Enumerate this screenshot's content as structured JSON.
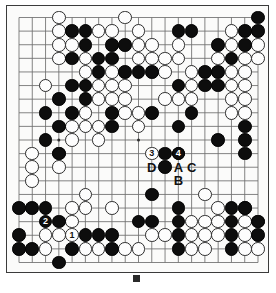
{
  "board": {
    "size": 19,
    "colors": {
      "black_stone": "#0d0d0d",
      "white_stone": "#fdfdfd",
      "board_background": "#fbfbfa",
      "grid_line": "#6e6e6e",
      "border": "#3b3b3b"
    },
    "hoshi": [
      [
        3,
        3
      ],
      [
        9,
        3
      ],
      [
        15,
        3
      ],
      [
        3,
        9
      ],
      [
        9,
        9
      ],
      [
        15,
        9
      ],
      [
        3,
        15
      ],
      [
        9,
        15
      ],
      [
        15,
        15
      ]
    ],
    "black_stones": [
      [
        18,
        0
      ],
      [
        4,
        1
      ],
      [
        5,
        1
      ],
      [
        12,
        1
      ],
      [
        13,
        1
      ],
      [
        17,
        1
      ],
      [
        18,
        1
      ],
      [
        5,
        2
      ],
      [
        7,
        2
      ],
      [
        8,
        2
      ],
      [
        15,
        2
      ],
      [
        17,
        2
      ],
      [
        4,
        3
      ],
      [
        6,
        3
      ],
      [
        7,
        3
      ],
      [
        16,
        3
      ],
      [
        6,
        4
      ],
      [
        8,
        4
      ],
      [
        9,
        4
      ],
      [
        10,
        4
      ],
      [
        14,
        4
      ],
      [
        15,
        4
      ],
      [
        4,
        5
      ],
      [
        5,
        5
      ],
      [
        12,
        5
      ],
      [
        14,
        5
      ],
      [
        15,
        5
      ],
      [
        3,
        6
      ],
      [
        5,
        6
      ],
      [
        2,
        7
      ],
      [
        4,
        7
      ],
      [
        7,
        7
      ],
      [
        10,
        7
      ],
      [
        13,
        7
      ],
      [
        3,
        8
      ],
      [
        7,
        8
      ],
      [
        12,
        8
      ],
      [
        17,
        8
      ],
      [
        2,
        9
      ],
      [
        15,
        9
      ],
      [
        17,
        9
      ],
      [
        3,
        10
      ],
      [
        11,
        10
      ],
      [
        12,
        10
      ],
      [
        17,
        10
      ],
      [
        11,
        11
      ],
      [
        10,
        13
      ],
      [
        0,
        14
      ],
      [
        1,
        14
      ],
      [
        2,
        14
      ],
      [
        12,
        14
      ],
      [
        16,
        14
      ],
      [
        17,
        14
      ],
      [
        3,
        15
      ],
      [
        9,
        15
      ],
      [
        10,
        15
      ],
      [
        12,
        15
      ],
      [
        16,
        15
      ],
      [
        18,
        15
      ],
      [
        0,
        16
      ],
      [
        5,
        16
      ],
      [
        6,
        16
      ],
      [
        7,
        16
      ],
      [
        12,
        16
      ],
      [
        16,
        16
      ],
      [
        18,
        16
      ],
      [
        0,
        17
      ],
      [
        1,
        17
      ],
      [
        4,
        17
      ],
      [
        7,
        17
      ],
      [
        12,
        17
      ],
      [
        16,
        17
      ],
      [
        3,
        18
      ]
    ],
    "white_stones": [
      [
        3,
        0
      ],
      [
        8,
        0
      ],
      [
        3,
        1
      ],
      [
        6,
        1
      ],
      [
        7,
        1
      ],
      [
        9,
        1
      ],
      [
        16,
        1
      ],
      [
        3,
        2
      ],
      [
        4,
        2
      ],
      [
        9,
        2
      ],
      [
        10,
        2
      ],
      [
        12,
        2
      ],
      [
        16,
        2
      ],
      [
        18,
        2
      ],
      [
        3,
        3
      ],
      [
        5,
        3
      ],
      [
        9,
        3
      ],
      [
        10,
        3
      ],
      [
        11,
        3
      ],
      [
        12,
        3
      ],
      [
        15,
        3
      ],
      [
        17,
        3
      ],
      [
        18,
        3
      ],
      [
        5,
        4
      ],
      [
        7,
        4
      ],
      [
        11,
        4
      ],
      [
        13,
        4
      ],
      [
        16,
        4
      ],
      [
        17,
        4
      ],
      [
        2,
        5
      ],
      [
        6,
        5
      ],
      [
        7,
        5
      ],
      [
        8,
        5
      ],
      [
        13,
        5
      ],
      [
        16,
        5
      ],
      [
        17,
        5
      ],
      [
        6,
        6
      ],
      [
        7,
        6
      ],
      [
        8,
        6
      ],
      [
        11,
        6
      ],
      [
        12,
        6
      ],
      [
        13,
        6
      ],
      [
        16,
        6
      ],
      [
        17,
        6
      ],
      [
        5,
        7
      ],
      [
        8,
        7
      ],
      [
        9,
        7
      ],
      [
        16,
        7
      ],
      [
        17,
        7
      ],
      [
        4,
        8
      ],
      [
        5,
        8
      ],
      [
        6,
        8
      ],
      [
        9,
        8
      ],
      [
        4,
        9
      ],
      [
        6,
        9
      ],
      [
        1,
        10
      ],
      [
        3,
        10
      ],
      [
        1,
        11
      ],
      [
        3,
        11
      ],
      [
        1,
        12
      ],
      [
        5,
        13
      ],
      [
        14,
        13
      ],
      [
        4,
        14
      ],
      [
        5,
        14
      ],
      [
        7,
        14
      ],
      [
        15,
        14
      ],
      [
        17,
        14
      ],
      [
        4,
        15
      ],
      [
        13,
        15
      ],
      [
        14,
        15
      ],
      [
        15,
        15
      ],
      [
        17,
        15
      ],
      [
        18,
        15
      ],
      [
        2,
        16
      ],
      [
        3,
        16
      ],
      [
        10,
        16
      ],
      [
        11,
        16
      ],
      [
        13,
        16
      ],
      [
        14,
        16
      ],
      [
        15,
        16
      ],
      [
        17,
        16
      ],
      [
        2,
        17
      ],
      [
        5,
        17
      ],
      [
        6,
        17
      ],
      [
        8,
        17
      ],
      [
        9,
        17
      ],
      [
        13,
        17
      ],
      [
        14,
        17
      ],
      [
        17,
        17
      ],
      [
        18,
        17
      ]
    ],
    "move_markers": [
      {
        "label": "1",
        "col": 4,
        "row": 16,
        "on": "white"
      },
      {
        "label": "2",
        "col": 2,
        "row": 15,
        "on": "black"
      },
      {
        "label": "3",
        "col": 10,
        "row": 10,
        "on": "white"
      },
      {
        "label": "4",
        "col": 12,
        "row": 10,
        "on": "black"
      }
    ],
    "letter_labels": [
      {
        "label": "D",
        "col": 10,
        "row": 11,
        "dark": false
      },
      {
        "label": "A",
        "col": 12,
        "row": 11,
        "dark": false
      },
      {
        "label": "C",
        "col": 13,
        "row": 11,
        "dark": false
      },
      {
        "label": "B",
        "col": 12,
        "row": 12,
        "dark": false
      }
    ]
  },
  "caption": {
    "icon": "filled-square-bullet",
    "text": ""
  }
}
